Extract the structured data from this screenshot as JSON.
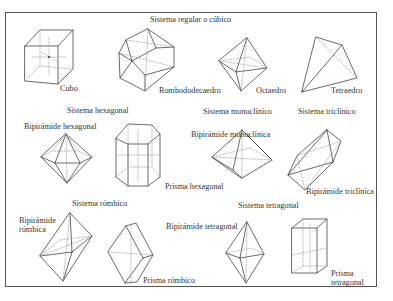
{
  "top_cut_text": "",
  "systems": [
    {
      "name": "Sistema regular o cúbico",
      "forms": [
        "Cubo",
        "Rombododecaedro",
        "Octaedro",
        "Tetraedro"
      ]
    },
    {
      "name": "Sistema hexagonal",
      "forms": [
        "Bipirámide hexagonal",
        "Prisma hexagonal"
      ]
    },
    {
      "name": "Sistema monoclínico",
      "forms": [
        "Bipirámide monoclínica"
      ]
    },
    {
      "name": "Sistema triclínico",
      "forms": [
        "Bipirámide triclínica"
      ]
    },
    {
      "name": "Sistema rómbico",
      "forms": [
        "Bipirámide rómbica",
        "Prisma rómbico"
      ]
    },
    {
      "name": "Sistema tetragonal",
      "forms": [
        "Bipirámide tetragonal",
        "Prisma tetragonal"
      ]
    }
  ],
  "labels": {
    "cubic_title": "Sistema regular o cúbico",
    "cubo": "Cubo",
    "rombododecaedro": "Rombododecaedro",
    "octaedro": "Octaedro",
    "tetraedro": "Tetraedro",
    "hex_title": "Sistema hexagonal",
    "bip_hex": "Bipirámide hexagonal",
    "prisma_hex": "Prisma hexagonal",
    "mono_title": "Sistema monoclínico",
    "bip_mono": "Bipirámide monoclínica",
    "tri_title": "Sistema triclínico",
    "bip_tri": "Bipirámide triclínica",
    "romb_title": "Sistema rómbico",
    "bip_romb_1": "Bipirámide",
    "bip_romb_2": "rómbica",
    "prisma_romb": "Prisma rómbico",
    "tetra_title": "Sistema tetragonal",
    "bip_tetra": "Bipirámide tetragonal",
    "prisma_tetra_1": "Prisma",
    "prisma_tetra_2": "tetragonal"
  }
}
